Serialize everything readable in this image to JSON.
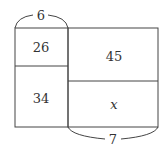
{
  "diagram": {
    "type": "area-model-rectangles",
    "colors": {
      "line": "#444444",
      "text": "#333333",
      "background": "#ffffff"
    },
    "top_brace": {
      "label": "6",
      "spans": "left column width"
    },
    "bottom_brace": {
      "label": "7",
      "spans": "right column width"
    },
    "cells": [
      {
        "position": "left-top",
        "value": "26"
      },
      {
        "position": "left-bottom",
        "value": "34"
      },
      {
        "position": "right-top",
        "value": "45"
      },
      {
        "position": "right-bottom",
        "value": "x"
      }
    ]
  }
}
